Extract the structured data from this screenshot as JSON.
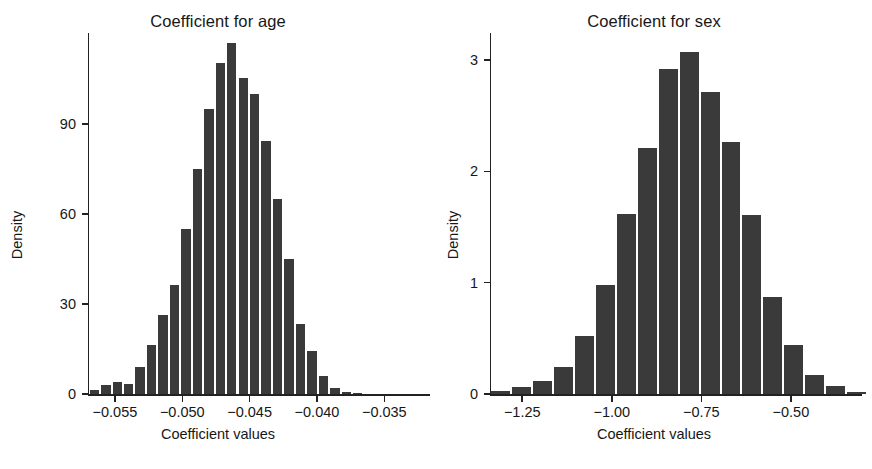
{
  "figure": {
    "background": "#ffffff",
    "bar_color": "#3a3a3a",
    "axis_color": "#222222"
  },
  "panels": [
    {
      "id": "age",
      "title": "Coefficient for age",
      "xlabel": "Coefficient values",
      "ylabel": "Density"
    },
    {
      "id": "sex",
      "title": "Coefficient for sex",
      "xlabel": "Coefficient values",
      "ylabel": "Density"
    }
  ],
  "chart_data": [
    {
      "type": "bar",
      "subtype": "histogram",
      "title": "Coefficient for age",
      "xlabel": "Coefficient values",
      "ylabel": "Density",
      "xlim": [
        -0.057,
        -0.0325
      ],
      "ylim": [
        0,
        118
      ],
      "xticks": [
        -0.055,
        -0.05,
        -0.045,
        -0.04,
        -0.035
      ],
      "xticklabels": [
        "−0.055",
        "−0.050",
        "−0.045",
        "−0.040",
        "−0.035"
      ],
      "yticks": [
        0,
        30,
        60,
        90
      ],
      "yticklabels": [
        "0",
        "30",
        "60",
        "90"
      ],
      "grid": false,
      "legend": null,
      "bin_width": 0.00085,
      "bin_left_edges": [
        -0.05695,
        -0.0561,
        -0.05525,
        -0.0544,
        -0.05355,
        -0.0527,
        -0.05185,
        -0.051,
        -0.05015,
        -0.0493,
        -0.04845,
        -0.0476,
        -0.04675,
        -0.0459,
        -0.04505,
        -0.0442,
        -0.04335,
        -0.0425,
        -0.04165,
        -0.0408,
        -0.03995,
        -0.0391,
        -0.03825,
        -0.0374,
        -0.03655,
        -0.0357,
        -0.03485,
        -0.034
      ],
      "bin_centers": [
        -0.05653,
        -0.05568,
        -0.05483,
        -0.05398,
        -0.05313,
        -0.05228,
        -0.05143,
        -0.05058,
        -0.04973,
        -0.04888,
        -0.04803,
        -0.04718,
        -0.04633,
        -0.04548,
        -0.04463,
        -0.04378,
        -0.04293,
        -0.04208,
        -0.04123,
        -0.04038,
        -0.03953,
        -0.03868,
        -0.03783,
        -0.03698,
        -0.03613,
        -0.03528,
        -0.03443,
        -0.03358
      ],
      "values": [
        1.5,
        3.0,
        4.0,
        3.5,
        9.0,
        16.5,
        26.5,
        36.5,
        55.0,
        75.0,
        95.0,
        110.5,
        117.0,
        105.5,
        100.0,
        84.5,
        65.0,
        45.0,
        23.5,
        14.5,
        6.0,
        2.0,
        0.8,
        0.4,
        0,
        0,
        0,
        0
      ]
    },
    {
      "type": "bar",
      "subtype": "histogram",
      "title": "Coefficient for sex",
      "xlabel": "Coefficient values",
      "ylabel": "Density",
      "xlim": [
        -1.34,
        -0.335
      ],
      "ylim": [
        0,
        3.18
      ],
      "xticks": [
        -1.25,
        -1.0,
        -0.75,
        -0.5
      ],
      "xticklabels": [
        "−1.25",
        "−1.00",
        "−0.75",
        "−0.50"
      ],
      "yticks": [
        0,
        1,
        2,
        3
      ],
      "yticklabels": [
        "0",
        "1",
        "2",
        "3"
      ],
      "grid": false,
      "legend": null,
      "bin_width": 0.0585,
      "bin_left_edges": [
        -1.34,
        -1.2815,
        -1.223,
        -1.1645,
        -1.106,
        -1.0475,
        -0.989,
        -0.9305,
        -0.872,
        -0.8135,
        -0.755,
        -0.6965,
        -0.638,
        -0.5795,
        -0.521,
        -0.4625,
        -0.404,
        -0.3455
      ],
      "bin_centers": [
        -1.3108,
        -1.2523,
        -1.1938,
        -1.1353,
        -1.0768,
        -1.0183,
        -0.9598,
        -0.9013,
        -0.8428,
        -0.7843,
        -0.7258,
        -0.6673,
        -0.6088,
        -0.5503,
        -0.4918,
        -0.4333,
        -0.3748,
        -0.3163
      ],
      "values": [
        0.03,
        0.06,
        0.12,
        0.24,
        0.52,
        0.98,
        1.62,
        2.21,
        2.92,
        3.07,
        2.71,
        2.26,
        1.61,
        0.87,
        0.44,
        0.17,
        0.07,
        0.02
      ]
    }
  ]
}
